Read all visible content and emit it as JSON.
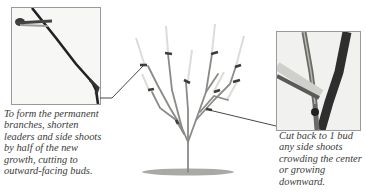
{
  "figure": {
    "left_callout": {
      "photo": "shortening-leader-with-pruners",
      "caption_lines": [
        "To form the permanent",
        "branches, shorten",
        "leaders and side shoots",
        "by half of the new",
        "growth, cutting to",
        "outward-facing buds."
      ]
    },
    "right_callout": {
      "photo": "cutting-side-shoot-with-pruners",
      "caption_lines": [
        "Cut back to 1 bud",
        "any side shoots",
        "crowding the center",
        "or growing",
        "downward."
      ]
    },
    "colors": {
      "branch": "#8a8a86",
      "cut_mark": "#3c3c3c",
      "leader_line": "#333333",
      "caption": "#3a3a3a",
      "ground": "#8d8d8a"
    }
  }
}
